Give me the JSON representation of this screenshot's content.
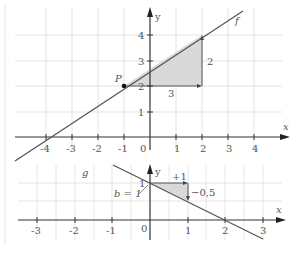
{
  "top_graph": {
    "function_label": "f",
    "point_label": "P",
    "axis_x_label": "x",
    "axis_y_label": "y",
    "x_ticks": [
      "-4",
      "-3",
      "-2",
      "-1",
      "0",
      "1",
      "2",
      "3",
      "4"
    ],
    "y_ticks": [
      "1",
      "2",
      "3",
      "4"
    ],
    "run_label": "3",
    "rise_label": "2"
  },
  "bottom_graph": {
    "function_label": "g",
    "axis_x_label": "x",
    "axis_y_label": "y",
    "x_ticks": [
      "-3",
      "-2",
      "-1",
      "0",
      "1",
      "2",
      "3"
    ],
    "y_tick": "1",
    "intercept_label": "b = 1",
    "run_label": "+1",
    "rise_label": "−0,5"
  },
  "colors": {
    "grid": "#d8d8d8",
    "axis": "#333333",
    "line": "#555555",
    "fill": "#d9d9d9",
    "text": "#555555"
  }
}
